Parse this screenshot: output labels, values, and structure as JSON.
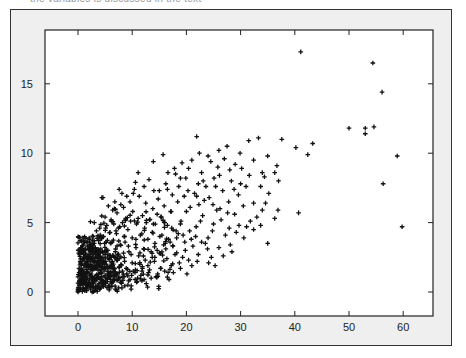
{
  "header": {
    "clipped_caption": "the variables is discussed in the text"
  },
  "colors": {
    "frame_bg": "#efefef",
    "plot_bg": "#ffffff",
    "axis": "#222222",
    "marker": "#111111"
  },
  "chart_data": {
    "type": "scatter",
    "title": "",
    "xlabel": "",
    "ylabel": "",
    "xlim": [
      -6,
      65
    ],
    "ylim": [
      -1.7,
      18.9
    ],
    "grid": false,
    "legend": null,
    "marker": "+",
    "xticks": [
      0,
      10,
      20,
      30,
      40,
      50,
      60
    ],
    "yticks": [
      0,
      5,
      10,
      15
    ],
    "xtick_labels": [
      "0",
      "10",
      "20",
      "30",
      "40",
      "50",
      "60"
    ],
    "ytick_labels": [
      "0",
      "5",
      "10",
      "15"
    ],
    "points": [
      [
        41.1,
        17.3
      ],
      [
        54.4,
        16.5
      ],
      [
        56.1,
        14.4
      ],
      [
        50.0,
        11.8
      ],
      [
        53.0,
        11.8
      ],
      [
        54.6,
        11.9
      ],
      [
        53.0,
        11.4
      ],
      [
        58.9,
        9.8
      ],
      [
        56.3,
        7.8
      ],
      [
        59.8,
        4.7
      ],
      [
        31.5,
        10.9
      ],
      [
        33.3,
        11.1
      ],
      [
        37.6,
        11.0
      ],
      [
        40.2,
        10.4
      ],
      [
        43.3,
        10.7
      ],
      [
        42.4,
        9.9
      ],
      [
        21.9,
        11.2
      ],
      [
        15.7,
        9.9
      ],
      [
        13.9,
        9.4
      ],
      [
        11.1,
        8.6
      ],
      [
        32.4,
        9.5
      ],
      [
        35.0,
        9.8
      ],
      [
        36.7,
        9.1
      ],
      [
        34.0,
        8.6
      ],
      [
        34.4,
        8.3
      ],
      [
        36.3,
        8.6
      ],
      [
        37.0,
        8.0
      ],
      [
        33.7,
        7.6
      ],
      [
        35.2,
        7.1
      ],
      [
        32.4,
        6.4
      ],
      [
        34.6,
        6.4
      ],
      [
        34.0,
        5.9
      ],
      [
        36.9,
        5.9
      ],
      [
        40.7,
        5.7
      ],
      [
        36.3,
        5.3
      ],
      [
        33.0,
        5.4
      ],
      [
        33.7,
        4.8
      ],
      [
        32.4,
        4.5
      ],
      [
        35.0,
        3.5
      ],
      [
        13.1,
        8.1
      ],
      [
        18.0,
        8.5
      ],
      [
        18.9,
        8.2
      ],
      [
        10.6,
        7.9
      ],
      [
        10.4,
        7.4
      ],
      [
        7.6,
        7.4
      ],
      [
        10.2,
        7.1
      ],
      [
        4.6,
        6.8
      ],
      [
        4.4,
        6.8
      ],
      [
        15.0,
        7.3
      ],
      [
        26.0,
        10.2
      ],
      [
        27.5,
        10.5
      ],
      [
        24.5,
        9.4
      ],
      [
        29.0,
        9.2
      ],
      [
        30.2,
        8.9
      ],
      [
        22.8,
        8.6
      ],
      [
        25.1,
        8.2
      ],
      [
        28.3,
        8.0
      ],
      [
        20.4,
        8.9
      ],
      [
        19.2,
        9.3
      ],
      [
        23.6,
        7.6
      ],
      [
        26.7,
        7.3
      ],
      [
        29.6,
        7.0
      ],
      [
        31.0,
        7.6
      ],
      [
        21.5,
        7.1
      ],
      [
        24.2,
        6.8
      ],
      [
        27.8,
        6.5
      ],
      [
        30.5,
        6.2
      ],
      [
        22.3,
        6.3
      ],
      [
        25.6,
        5.9
      ],
      [
        28.9,
        5.6
      ],
      [
        31.8,
        5.1
      ],
      [
        20.0,
        5.8
      ],
      [
        23.0,
        5.5
      ],
      [
        26.4,
        5.2
      ],
      [
        29.7,
        4.8
      ],
      [
        19.0,
        5.1
      ],
      [
        21.8,
        4.7
      ],
      [
        24.8,
        4.4
      ],
      [
        27.2,
        4.1
      ],
      [
        30.6,
        3.9
      ],
      [
        18.5,
        4.2
      ],
      [
        20.9,
        3.8
      ],
      [
        23.5,
        3.5
      ],
      [
        26.0,
        3.2
      ],
      [
        28.4,
        2.9
      ],
      [
        17.5,
        3.3
      ],
      [
        19.8,
        3.0
      ],
      [
        22.2,
        2.7
      ],
      [
        24.6,
        2.5
      ],
      [
        16.4,
        2.4
      ],
      [
        18.7,
        2.1
      ],
      [
        21.0,
        1.9
      ],
      [
        15.3,
        1.7
      ],
      [
        17.6,
        1.4
      ],
      [
        20.1,
        1.3
      ],
      [
        14.4,
        1.1
      ],
      [
        16.8,
        0.9
      ],
      [
        12.6,
        0.6
      ],
      [
        14.9,
        0.4
      ],
      [
        11.8,
        1.5
      ],
      [
        16.2,
        7.8
      ],
      [
        17.4,
        7.0
      ],
      [
        14.8,
        6.7
      ],
      [
        12.5,
        6.4
      ],
      [
        13.8,
        6.0
      ],
      [
        15.9,
        6.2
      ],
      [
        17.1,
        5.8
      ],
      [
        18.4,
        6.5
      ],
      [
        19.6,
        6.9
      ],
      [
        20.7,
        6.1
      ],
      [
        11.3,
        6.9
      ],
      [
        9.6,
        6.5
      ],
      [
        8.4,
        6.1
      ],
      [
        10.1,
        5.8
      ],
      [
        11.9,
        5.5
      ],
      [
        13.2,
        5.2
      ],
      [
        14.6,
        5.6
      ],
      [
        16.0,
        5.0
      ],
      [
        17.3,
        4.6
      ],
      [
        18.9,
        4.9
      ],
      [
        7.2,
        5.7
      ],
      [
        8.8,
        5.3
      ],
      [
        6.1,
        5.2
      ],
      [
        5.3,
        4.8
      ],
      [
        7.7,
        4.7
      ],
      [
        9.2,
        4.5
      ],
      [
        10.8,
        4.9
      ],
      [
        12.3,
        4.6
      ],
      [
        13.7,
        4.3
      ],
      [
        15.1,
        4.0
      ],
      [
        16.7,
        3.8
      ],
      [
        14.2,
        3.5
      ],
      [
        12.9,
        3.8
      ],
      [
        11.5,
        4.1
      ],
      [
        10.0,
        3.9
      ],
      [
        8.6,
        4.0
      ],
      [
        7.1,
        4.2
      ],
      [
        5.9,
        4.3
      ],
      [
        4.7,
        4.0
      ],
      [
        3.8,
        3.7
      ],
      [
        4.9,
        3.5
      ],
      [
        6.3,
        3.6
      ],
      [
        7.8,
        3.4
      ],
      [
        9.3,
        3.3
      ],
      [
        10.7,
        3.2
      ],
      [
        12.1,
        3.1
      ],
      [
        13.5,
        2.9
      ],
      [
        15.0,
        2.8
      ],
      [
        16.2,
        3.1
      ],
      [
        17.9,
        2.7
      ],
      [
        19.3,
        2.5
      ],
      [
        11.2,
        2.6
      ],
      [
        9.8,
        2.7
      ],
      [
        8.4,
        2.8
      ],
      [
        6.9,
        2.9
      ],
      [
        5.5,
        3.0
      ],
      [
        4.2,
        3.1
      ],
      [
        3.2,
        3.2
      ],
      [
        2.6,
        2.9
      ],
      [
        3.5,
        2.6
      ],
      [
        4.6,
        2.5
      ],
      [
        5.8,
        2.4
      ],
      [
        7.1,
        2.3
      ],
      [
        8.6,
        2.2
      ],
      [
        10.0,
        2.1
      ],
      [
        11.4,
        2.0
      ],
      [
        12.9,
        1.9
      ],
      [
        14.1,
        2.2
      ],
      [
        13.0,
        1.4
      ],
      [
        11.6,
        1.2
      ],
      [
        10.2,
        1.5
      ],
      [
        8.9,
        1.7
      ],
      [
        7.6,
        1.8
      ],
      [
        6.4,
        1.9
      ],
      [
        5.2,
        2.0
      ],
      [
        4.0,
        2.1
      ],
      [
        2.9,
        2.2
      ],
      [
        2.0,
        2.4
      ],
      [
        1.5,
        2.6
      ],
      [
        1.2,
        3.0
      ],
      [
        2.2,
        3.4
      ],
      [
        1.9,
        1.9
      ],
      [
        2.8,
        1.7
      ],
      [
        3.7,
        1.6
      ],
      [
        4.8,
        1.5
      ],
      [
        6.0,
        1.4
      ],
      [
        7.3,
        1.3
      ],
      [
        8.5,
        1.1
      ],
      [
        9.6,
        0.9
      ],
      [
        10.8,
        0.7
      ],
      [
        9.2,
        0.5
      ],
      [
        7.9,
        0.7
      ],
      [
        6.7,
        0.9
      ],
      [
        5.5,
        1.0
      ],
      [
        4.4,
        1.1
      ],
      [
        3.4,
        1.2
      ],
      [
        2.4,
        1.3
      ],
      [
        1.6,
        1.4
      ],
      [
        0.9,
        1.6
      ],
      [
        0.6,
        2.0
      ],
      [
        0.4,
        1.2
      ],
      [
        0.8,
        0.9
      ],
      [
        1.3,
        0.8
      ],
      [
        2.0,
        0.7
      ],
      [
        2.8,
        0.6
      ],
      [
        3.7,
        0.5
      ],
      [
        4.7,
        0.4
      ],
      [
        5.8,
        0.3
      ],
      [
        6.9,
        0.2
      ],
      [
        8.1,
        0.3
      ],
      [
        0.2,
        0.5
      ],
      [
        0.5,
        0.3
      ],
      [
        1.0,
        0.2
      ],
      [
        1.6,
        0.1
      ],
      [
        2.3,
        0.2
      ],
      [
        3.1,
        0.1
      ],
      [
        4.0,
        0.2
      ],
      [
        0.1,
        0.1
      ],
      [
        0.3,
        0.8
      ],
      [
        0.7,
        0.6
      ],
      [
        1.1,
        1.1
      ],
      [
        1.8,
        1.0
      ],
      [
        2.5,
        0.9
      ],
      [
        3.3,
        0.8
      ],
      [
        4.2,
        0.7
      ],
      [
        5.1,
        0.6
      ],
      [
        6.2,
        0.6
      ],
      [
        0.2,
        1.4
      ],
      [
        0.6,
        1.7
      ],
      [
        1.3,
        1.8
      ],
      [
        0.4,
        2.2
      ],
      [
        0.9,
        2.4
      ],
      [
        1.7,
        2.2
      ],
      [
        2.3,
        2.0
      ],
      [
        3.0,
        1.9
      ],
      [
        3.9,
        1.9
      ],
      [
        4.5,
        1.8
      ],
      [
        5.4,
        1.7
      ],
      [
        6.6,
        1.6
      ],
      [
        0.3,
        2.7
      ],
      [
        0.8,
        2.9
      ],
      [
        1.4,
        2.8
      ],
      [
        2.0,
        2.7
      ],
      [
        2.7,
        2.5
      ],
      [
        3.6,
        2.4
      ],
      [
        4.3,
        2.3
      ],
      [
        5.1,
        2.2
      ],
      [
        6.2,
        2.1
      ],
      [
        0.5,
        3.2
      ],
      [
        1.0,
        3.4
      ],
      [
        1.7,
        3.3
      ],
      [
        2.5,
        3.1
      ],
      [
        3.3,
        2.9
      ],
      [
        4.1,
        2.8
      ],
      [
        5.0,
        2.7
      ],
      [
        6.0,
        2.6
      ],
      [
        7.3,
        2.6
      ],
      [
        0.6,
        1.0
      ],
      [
        1.4,
        0.5
      ],
      [
        2.1,
        0.4
      ],
      [
        2.7,
        1.1
      ],
      [
        3.5,
        1.0
      ],
      [
        4.3,
        0.9
      ],
      [
        5.0,
        1.2
      ],
      [
        5.9,
        1.1
      ],
      [
        6.8,
        1.2
      ],
      [
        7.5,
        1.0
      ],
      [
        8.2,
        1.5
      ],
      [
        9.0,
        1.3
      ],
      [
        9.9,
        1.2
      ],
      [
        10.6,
        1.6
      ],
      [
        11.9,
        1.7
      ],
      [
        12.4,
        2.3
      ],
      [
        13.7,
        2.5
      ],
      [
        14.6,
        3.0
      ],
      [
        15.8,
        3.4
      ],
      [
        17.0,
        3.6
      ],
      [
        18.2,
        3.9
      ],
      [
        19.4,
        4.1
      ],
      [
        20.6,
        4.4
      ],
      [
        21.7,
        4.0
      ],
      [
        22.8,
        3.6
      ],
      [
        23.9,
        3.1
      ],
      [
        24.1,
        2.1
      ],
      [
        25.3,
        1.9
      ],
      [
        22.0,
        2.2
      ],
      [
        20.4,
        2.3
      ],
      [
        18.9,
        1.7
      ],
      [
        17.2,
        1.9
      ],
      [
        16.0,
        1.5
      ],
      [
        14.7,
        1.3
      ],
      [
        13.5,
        1.0
      ],
      [
        12.2,
        0.9
      ],
      [
        11.0,
        1.0
      ],
      [
        9.8,
        0.2
      ],
      [
        3.4,
        4.4
      ],
      [
        2.8,
        4.0
      ],
      [
        2.1,
        3.8
      ],
      [
        4.0,
        4.6
      ],
      [
        5.0,
        5.4
      ],
      [
        6.4,
        5.9
      ],
      [
        7.9,
        6.3
      ],
      [
        9.0,
        6.9
      ],
      [
        6.8,
        6.5
      ],
      [
        8.1,
        7.1
      ],
      [
        5.6,
        6.2
      ],
      [
        3.0,
        5.0
      ],
      [
        14.0,
        7.3
      ],
      [
        16.5,
        7.4
      ],
      [
        12.2,
        7.6
      ],
      [
        18.6,
        7.6
      ],
      [
        20.3,
        7.3
      ],
      [
        21.9,
        6.9
      ],
      [
        23.3,
        6.6
      ],
      [
        24.9,
        6.3
      ],
      [
        26.2,
        6.0
      ],
      [
        27.6,
        5.7
      ],
      [
        22.6,
        5.1
      ],
      [
        25.0,
        4.9
      ],
      [
        27.9,
        4.6
      ],
      [
        29.2,
        4.3
      ],
      [
        31.1,
        4.7
      ],
      [
        28.1,
        3.4
      ],
      [
        26.8,
        2.6
      ],
      [
        24.0,
        3.9
      ],
      [
        21.2,
        3.3
      ],
      [
        19.7,
        3.6
      ],
      [
        18.1,
        4.4
      ],
      [
        16.5,
        4.8
      ],
      [
        15.4,
        5.4
      ],
      [
        13.9,
        4.9
      ],
      [
        12.6,
        5.0
      ],
      [
        11.1,
        5.3
      ],
      [
        9.7,
        5.1
      ],
      [
        8.2,
        5.0
      ],
      [
        6.6,
        4.9
      ],
      [
        5.1,
        4.6
      ],
      [
        4.1,
        3.9
      ],
      [
        3.0,
        3.5
      ],
      [
        2.3,
        3.2
      ],
      [
        1.5,
        3.6
      ],
      [
        0.9,
        3.9
      ],
      [
        0.4,
        3.7
      ],
      [
        22.4,
        10.0
      ],
      [
        24.0,
        9.8
      ],
      [
        27.0,
        9.6
      ],
      [
        29.9,
        10.0
      ],
      [
        25.8,
        9.0
      ],
      [
        21.0,
        9.5
      ],
      [
        19.9,
        8.2
      ],
      [
        23.1,
        8.0
      ],
      [
        26.1,
        8.4
      ],
      [
        28.0,
        8.8
      ],
      [
        31.6,
        8.4
      ],
      [
        30.0,
        7.8
      ],
      [
        28.8,
        7.4
      ],
      [
        25.4,
        7.6
      ],
      [
        22.2,
        7.8
      ],
      [
        17.8,
        8.9
      ],
      [
        16.6,
        8.6
      ]
    ]
  }
}
